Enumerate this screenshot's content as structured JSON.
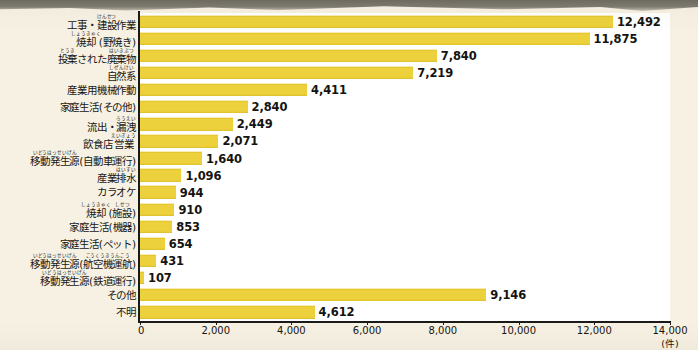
{
  "chart_data": {
    "type": "bar",
    "orientation": "horizontal",
    "title": "",
    "xlabel": "",
    "ylabel": "",
    "unit_label": "(件)",
    "xlim": [
      0,
      14000
    ],
    "grid": false,
    "legend": null,
    "bar_color": "#ecd13c",
    "background_color": "#f6f1e3",
    "plot_background_color": "#ffffff",
    "axis_color": "#1a1a18",
    "xticks": [
      0,
      2000,
      4000,
      6000,
      8000,
      10000,
      12000,
      14000
    ],
    "xticklabels": [
      "0",
      "2,000",
      "4,000",
      "6,000",
      "8,000",
      "10,000",
      "12,000",
      "14,000"
    ],
    "categories": [
      "工事・建設作業",
      "焼却(野焼き)",
      "投棄された廃棄物",
      "自然系",
      "産業用機械作動",
      "家庭生活(その他)",
      "流出・漏洩",
      "飲食店営業",
      "移動発生源(自動車運行)",
      "産業排水",
      "カラオケ",
      "焼却(施設)",
      "家庭生活(機器)",
      "家庭生活(ペット)",
      "移動発生源(航空機運航)",
      "移動発生源(鉄道運行)",
      "その他",
      "不明"
    ],
    "values": [
      12492,
      11875,
      7840,
      7219,
      4411,
      2840,
      2449,
      2071,
      1640,
      1096,
      944,
      910,
      853,
      654,
      431,
      107,
      9146,
      4612
    ],
    "value_labels": [
      "12,492",
      "11,875",
      "7,840",
      "7,219",
      "4,411",
      "2,840",
      "2,449",
      "2,071",
      "1,640",
      "1,096",
      "944",
      "910",
      "853",
      "654",
      "431",
      "107",
      "9,146",
      "4,612"
    ]
  },
  "rows": [
    {
      "value_label": "12,492",
      "value": 12492,
      "label_parts": [
        {
          "base": "工事・"
        },
        {
          "base": "建設",
          "ruby": "けんせつ"
        },
        {
          "base": "作業"
        }
      ]
    },
    {
      "value_label": "11,875",
      "value": 11875,
      "label_parts": [
        {
          "base": "焼却",
          "ruby": "しょうきゃく"
        },
        {
          "base": "(野焼き)"
        }
      ]
    },
    {
      "value_label": "7,840",
      "value": 7840,
      "label_parts": [
        {
          "base": "投棄",
          "ruby": "とうき"
        },
        {
          "base": "された"
        },
        {
          "base": "廃棄物",
          "ruby": "はいきぶつ"
        }
      ]
    },
    {
      "value_label": "7,219",
      "value": 7219,
      "label_parts": [
        {
          "base": "自然系",
          "ruby": "しぜんけい"
        }
      ]
    },
    {
      "value_label": "4,411",
      "value": 4411,
      "label_parts": [
        {
          "base": "産業用機械作動"
        }
      ]
    },
    {
      "value_label": "2,840",
      "value": 2840,
      "label_parts": [
        {
          "base": "家庭生活(その他)"
        }
      ]
    },
    {
      "value_label": "2,449",
      "value": 2449,
      "label_parts": [
        {
          "base": "流出・"
        },
        {
          "base": "漏洩",
          "ruby": "ろうえい"
        }
      ]
    },
    {
      "value_label": "2,071",
      "value": 2071,
      "label_parts": [
        {
          "base": "飲食店"
        },
        {
          "base": "営業",
          "ruby": "えいぎょう"
        }
      ]
    },
    {
      "value_label": "1,640",
      "value": 1640,
      "label_parts": [
        {
          "base": "移動発生源",
          "ruby": "いどうはっせいげん"
        },
        {
          "base": "(自動車運行)"
        }
      ]
    },
    {
      "value_label": "1,096",
      "value": 1096,
      "label_parts": [
        {
          "base": "産業"
        },
        {
          "base": "排水",
          "ruby": "はいすい"
        }
      ]
    },
    {
      "value_label": "944",
      "value": 944,
      "label_parts": [
        {
          "base": "カラオケ"
        }
      ]
    },
    {
      "value_label": "910",
      "value": 910,
      "label_parts": [
        {
          "base": "焼却",
          "ruby": "しょうきゃく"
        },
        {
          "base": "("
        },
        {
          "base": "施設",
          "ruby": "しせつ"
        },
        {
          "base": ")"
        }
      ]
    },
    {
      "value_label": "853",
      "value": 853,
      "label_parts": [
        {
          "base": "家庭生活(機器)"
        }
      ]
    },
    {
      "value_label": "654",
      "value": 654,
      "label_parts": [
        {
          "base": "家庭生活(ペット)"
        }
      ]
    },
    {
      "value_label": "431",
      "value": 431,
      "label_parts": [
        {
          "base": "移動発生源",
          "ruby": "いどうはっせいげん"
        },
        {
          "base": "("
        },
        {
          "base": "航空機運航",
          "ruby": "こうくうきうんこう"
        },
        {
          "base": ")"
        }
      ]
    },
    {
      "value_label": "107",
      "value": 107,
      "label_parts": [
        {
          "base": "移動発生源",
          "ruby": "いどうはっせいげん"
        },
        {
          "base": "(鉄道運行)"
        }
      ]
    },
    {
      "value_label": "9,146",
      "value": 9146,
      "label_parts": [
        {
          "base": "その他"
        }
      ]
    },
    {
      "value_label": "4,612",
      "value": 4612,
      "label_parts": [
        {
          "base": "不明"
        }
      ]
    }
  ]
}
